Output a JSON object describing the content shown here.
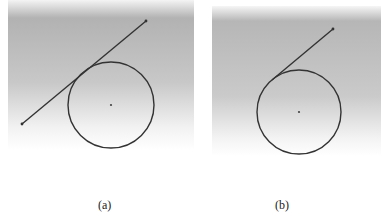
{
  "figure": {
    "panels": [
      {
        "id": "a",
        "caption": "(a)",
        "description": "Line passing near circle (secant/tangent line extending beyond circle)",
        "background_gradient": [
          "#a9a9a9",
          "#ffffff"
        ],
        "circle": {
          "cx": 111,
          "cy": 105,
          "r": 43
        },
        "line": {
          "x1": 22,
          "y1": 124,
          "x2": 146,
          "y2": 21
        }
      },
      {
        "id": "b",
        "caption": "(b)",
        "description": "Line segment ending at point of tangency on circle",
        "background_gradient": [
          "#a9a9a9",
          "#ffffff"
        ],
        "circle": {
          "cx": 299,
          "cy": 112,
          "r": 42
        },
        "line": {
          "x1": 272,
          "y1": 80,
          "x2": 333,
          "y2": 29
        }
      }
    ],
    "stroke_color": "#333333"
  }
}
